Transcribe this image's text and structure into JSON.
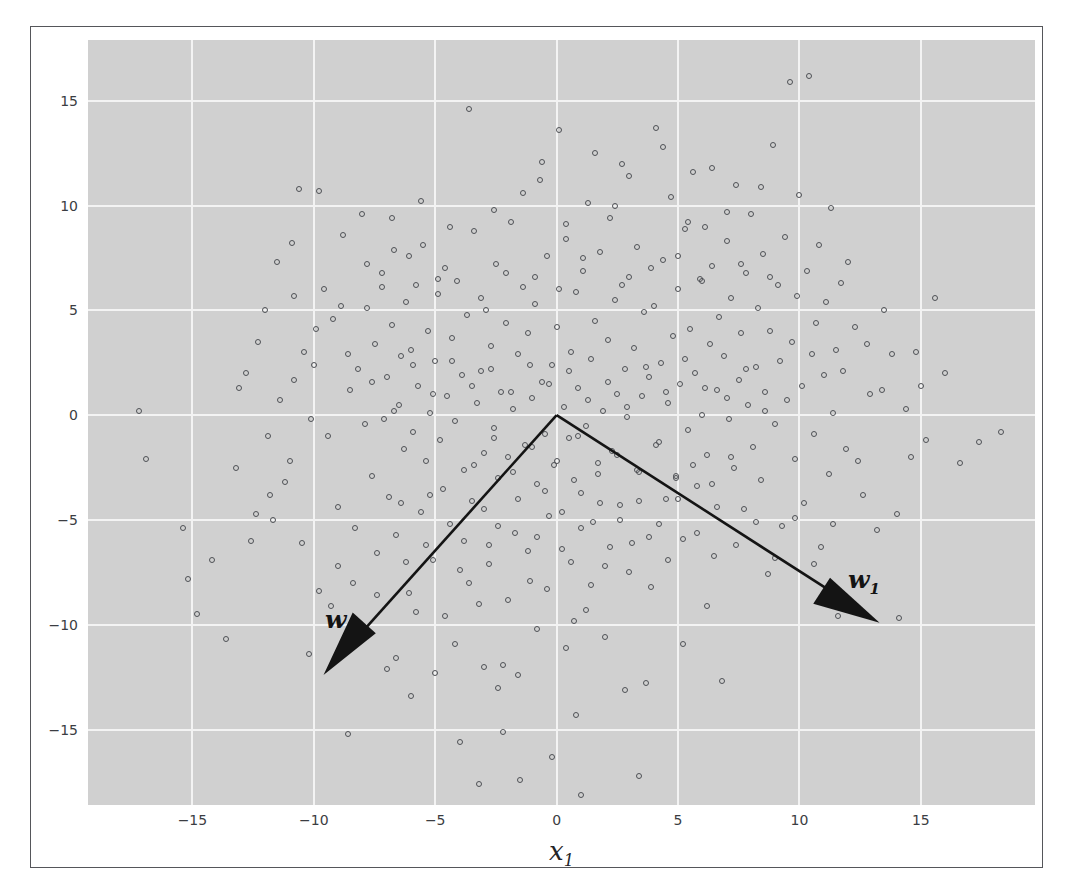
{
  "figure": {
    "background": "#ffffff",
    "frame_color": "#55565a",
    "plot_background": "#d0d0d0",
    "grid_color": "#f3f3f3",
    "marker_color": "#4e5055",
    "arrow_color": "#141414"
  },
  "annotations": {
    "w0_label": "w",
    "w0_sub": "0",
    "w1_label": "w",
    "w1_sub": "1"
  },
  "chart_data": {
    "type": "scatter",
    "title": "",
    "xlabel": "x",
    "xlabel_sub": "1",
    "ylabel": "",
    "xlim": [
      -19.3,
      19.7
    ],
    "ylim": [
      -18.6,
      17.9
    ],
    "grid": true,
    "legend": null,
    "xticks": [
      -15,
      -10,
      -5,
      0,
      5,
      10,
      15
    ],
    "yticks": [
      -15,
      -10,
      -5,
      0,
      5,
      10,
      15
    ],
    "xticklabels": [
      "−15",
      "−10",
      "−5",
      "0",
      "5",
      "10",
      "15"
    ],
    "yticklabels": [
      "−15",
      "−10",
      "−5",
      "0",
      "5",
      "10",
      "15"
    ],
    "marker": "open-circle",
    "marker_size": 6,
    "n_points": 420,
    "vectors": [
      {
        "name": "w0",
        "start": [
          0,
          0
        ],
        "end": [
          -9.6,
          -12.4
        ],
        "label": "w",
        "sub": "0"
      },
      {
        "name": "w1",
        "start": [
          0,
          0
        ],
        "end": [
          13.3,
          -9.9
        ],
        "label": "w",
        "sub": "1"
      }
    ],
    "points": [
      [
        -17.2,
        0.2
      ],
      [
        -16.9,
        -2.1
      ],
      [
        -15.4,
        -5.4
      ],
      [
        -14.8,
        -9.5
      ],
      [
        -13.6,
        -10.7
      ],
      [
        -13.1,
        1.3
      ],
      [
        -12.6,
        -6.0
      ],
      [
        -12.3,
        3.5
      ],
      [
        -11.7,
        -5.0
      ],
      [
        -11.4,
        0.7
      ],
      [
        -11.2,
        -3.2
      ],
      [
        -10.8,
        5.7
      ],
      [
        -10.6,
        10.8
      ],
      [
        -10.4,
        3.0
      ],
      [
        -10.2,
        -11.4
      ],
      [
        -10.0,
        2.4
      ],
      [
        -9.8,
        10.7
      ],
      [
        -9.6,
        6.0
      ],
      [
        -9.4,
        -1.0
      ],
      [
        -9.2,
        4.6
      ],
      [
        -9.0,
        -4.4
      ],
      [
        -8.8,
        8.6
      ],
      [
        -8.6,
        -15.2
      ],
      [
        -8.5,
        1.2
      ],
      [
        -8.3,
        -5.4
      ],
      [
        -8.2,
        2.2
      ],
      [
        -8.0,
        9.6
      ],
      [
        -7.9,
        -0.4
      ],
      [
        -7.8,
        5.1
      ],
      [
        -7.6,
        -2.9
      ],
      [
        -7.5,
        3.4
      ],
      [
        -7.4,
        -6.6
      ],
      [
        -7.2,
        6.8
      ],
      [
        -7.1,
        -0.2
      ],
      [
        -7.0,
        1.8
      ],
      [
        -6.9,
        -3.9
      ],
      [
        -6.8,
        4.3
      ],
      [
        -6.7,
        7.9
      ],
      [
        -6.6,
        -5.7
      ],
      [
        -6.5,
        0.5
      ],
      [
        -6.4,
        2.8
      ],
      [
        -6.3,
        -1.6
      ],
      [
        -6.2,
        5.4
      ],
      [
        -6.1,
        -8.5
      ],
      [
        -6.0,
        3.1
      ],
      [
        -5.9,
        -0.8
      ],
      [
        -5.8,
        6.2
      ],
      [
        -5.7,
        1.4
      ],
      [
        -5.6,
        -4.6
      ],
      [
        -5.5,
        8.1
      ],
      [
        -5.4,
        -2.2
      ],
      [
        -5.3,
        4.0
      ],
      [
        -5.2,
        0.1
      ],
      [
        -5.1,
        -6.9
      ],
      [
        -5.0,
        2.6
      ],
      [
        -4.9,
        5.8
      ],
      [
        -4.8,
        -1.2
      ],
      [
        -4.7,
        -3.5
      ],
      [
        -4.6,
        7.0
      ],
      [
        -4.5,
        0.9
      ],
      [
        -4.4,
        -5.2
      ],
      [
        -4.3,
        3.7
      ],
      [
        -4.2,
        -0.3
      ],
      [
        -4.1,
        6.4
      ],
      [
        -4.0,
        -7.4
      ],
      [
        -3.9,
        1.9
      ],
      [
        -3.8,
        -2.6
      ],
      [
        -3.7,
        4.8
      ],
      [
        -3.6,
        14.6
      ],
      [
        -3.5,
        -4.1
      ],
      [
        -3.4,
        8.8
      ],
      [
        -3.3,
        0.6
      ],
      [
        -3.2,
        -9.0
      ],
      [
        -3.1,
        2.1
      ],
      [
        -3.0,
        -1.8
      ],
      [
        -2.9,
        5.0
      ],
      [
        -2.8,
        -6.2
      ],
      [
        -2.7,
        3.3
      ],
      [
        -2.6,
        -0.6
      ],
      [
        -2.5,
        7.2
      ],
      [
        -2.4,
        -3.0
      ],
      [
        -2.3,
        1.1
      ],
      [
        -2.2,
        -11.9
      ],
      [
        -2.1,
        4.4
      ],
      [
        -2.0,
        -2.0
      ],
      [
        -1.9,
        9.2
      ],
      [
        -1.8,
        0.3
      ],
      [
        -1.7,
        -5.6
      ],
      [
        -1.6,
        2.9
      ],
      [
        -1.5,
        -17.4
      ],
      [
        -1.4,
        6.1
      ],
      [
        -1.3,
        -1.4
      ],
      [
        -1.2,
        3.9
      ],
      [
        -1.1,
        -7.9
      ],
      [
        -1.0,
        0.8
      ],
      [
        -0.9,
        5.3
      ],
      [
        -0.8,
        -3.3
      ],
      [
        -0.7,
        11.2
      ],
      [
        -0.6,
        1.6
      ],
      [
        -0.5,
        -0.9
      ],
      [
        -0.4,
        7.6
      ],
      [
        -0.3,
        -4.8
      ],
      [
        -0.2,
        2.4
      ],
      [
        -0.1,
        -2.4
      ],
      [
        0.0,
        4.2
      ],
      [
        0.1,
        13.6
      ],
      [
        0.2,
        -6.4
      ],
      [
        0.3,
        0.4
      ],
      [
        0.4,
        8.4
      ],
      [
        0.5,
        -1.1
      ],
      [
        0.6,
        3.0
      ],
      [
        0.7,
        -9.8
      ],
      [
        0.8,
        5.9
      ],
      [
        0.9,
        1.3
      ],
      [
        1.0,
        -3.7
      ],
      [
        1.1,
        6.9
      ],
      [
        1.2,
        -0.5
      ],
      [
        1.3,
        10.1
      ],
      [
        1.4,
        2.7
      ],
      [
        1.5,
        -5.1
      ],
      [
        1.6,
        4.5
      ],
      [
        1.7,
        -2.3
      ],
      [
        1.8,
        7.8
      ],
      [
        1.9,
        0.2
      ],
      [
        2.0,
        -7.2
      ],
      [
        2.1,
        3.6
      ],
      [
        2.2,
        9.4
      ],
      [
        2.3,
        -1.7
      ],
      [
        2.4,
        5.5
      ],
      [
        2.5,
        1.0
      ],
      [
        2.6,
        -4.3
      ],
      [
        2.7,
        12.0
      ],
      [
        2.8,
        2.2
      ],
      [
        2.9,
        -0.1
      ],
      [
        3.0,
        6.6
      ],
      [
        3.1,
        -6.1
      ],
      [
        3.2,
        3.2
      ],
      [
        3.3,
        8.0
      ],
      [
        3.4,
        -2.7
      ],
      [
        3.5,
        0.9
      ],
      [
        3.6,
        4.9
      ],
      [
        3.7,
        -12.8
      ],
      [
        3.8,
        1.8
      ],
      [
        3.9,
        -8.2
      ],
      [
        4.0,
        5.2
      ],
      [
        4.1,
        13.7
      ],
      [
        4.2,
        -1.3
      ],
      [
        4.3,
        2.5
      ],
      [
        4.4,
        7.4
      ],
      [
        4.5,
        -4.0
      ],
      [
        4.6,
        0.6
      ],
      [
        4.7,
        10.4
      ],
      [
        4.8,
        3.8
      ],
      [
        4.9,
        -2.9
      ],
      [
        5.0,
        6.0
      ],
      [
        5.1,
        1.5
      ],
      [
        5.2,
        -5.9
      ],
      [
        5.3,
        8.9
      ],
      [
        5.4,
        -0.7
      ],
      [
        5.5,
        4.1
      ],
      [
        5.6,
        11.6
      ],
      [
        5.7,
        2.0
      ],
      [
        5.8,
        -3.4
      ],
      [
        5.9,
        6.5
      ],
      [
        6.0,
        0.0
      ],
      [
        6.1,
        9.0
      ],
      [
        6.2,
        -1.9
      ],
      [
        6.3,
        3.4
      ],
      [
        6.4,
        7.1
      ],
      [
        6.5,
        -6.7
      ],
      [
        6.6,
        1.2
      ],
      [
        6.7,
        4.7
      ],
      [
        6.8,
        -12.7
      ],
      [
        6.9,
        2.8
      ],
      [
        7.0,
        8.3
      ],
      [
        7.1,
        -0.2
      ],
      [
        7.2,
        5.6
      ],
      [
        7.3,
        -2.5
      ],
      [
        7.4,
        11.0
      ],
      [
        7.5,
        1.7
      ],
      [
        7.6,
        3.9
      ],
      [
        7.7,
        -4.5
      ],
      [
        7.8,
        6.8
      ],
      [
        7.9,
        0.5
      ],
      [
        8.0,
        9.6
      ],
      [
        8.1,
        -1.5
      ],
      [
        8.2,
        2.3
      ],
      [
        8.3,
        5.1
      ],
      [
        8.4,
        -3.1
      ],
      [
        8.5,
        7.7
      ],
      [
        8.6,
        1.1
      ],
      [
        8.7,
        -7.6
      ],
      [
        8.8,
        4.0
      ],
      [
        8.9,
        12.9
      ],
      [
        9.0,
        -0.4
      ],
      [
        9.1,
        6.2
      ],
      [
        9.2,
        2.6
      ],
      [
        9.3,
        -5.3
      ],
      [
        9.4,
        8.5
      ],
      [
        9.5,
        0.7
      ],
      [
        9.6,
        15.9
      ],
      [
        9.7,
        3.5
      ],
      [
        9.8,
        -2.1
      ],
      [
        9.9,
        5.7
      ],
      [
        10.0,
        10.5
      ],
      [
        10.1,
        1.4
      ],
      [
        10.2,
        -4.2
      ],
      [
        10.3,
        6.9
      ],
      [
        10.4,
        16.2
      ],
      [
        10.5,
        2.9
      ],
      [
        10.6,
        -0.9
      ],
      [
        10.7,
        4.4
      ],
      [
        10.8,
        8.1
      ],
      [
        10.9,
        -6.3
      ],
      [
        11.0,
        1.9
      ],
      [
        11.1,
        5.4
      ],
      [
        11.2,
        -2.8
      ],
      [
        11.3,
        9.9
      ],
      [
        11.4,
        0.1
      ],
      [
        11.5,
        3.1
      ],
      [
        11.6,
        -9.6
      ],
      [
        11.7,
        6.3
      ],
      [
        11.8,
        2.1
      ],
      [
        11.9,
        -1.6
      ],
      [
        12.0,
        7.3
      ],
      [
        12.3,
        4.2
      ],
      [
        12.6,
        -3.8
      ],
      [
        12.9,
        1.0
      ],
      [
        13.2,
        -5.5
      ],
      [
        13.5,
        5.0
      ],
      [
        13.8,
        2.9
      ],
      [
        14.1,
        -9.7
      ],
      [
        14.4,
        0.3
      ],
      [
        14.8,
        3.0
      ],
      [
        15.2,
        -1.2
      ],
      [
        15.6,
        5.6
      ],
      [
        16.0,
        2.0
      ],
      [
        16.6,
        -2.3
      ],
      [
        17.4,
        -1.3
      ],
      [
        18.3,
        -0.8
      ],
      [
        -3.0,
        -12.0
      ],
      [
        -2.4,
        -13.0
      ],
      [
        -1.6,
        -12.4
      ],
      [
        -0.8,
        -10.2
      ],
      [
        0.4,
        -11.1
      ],
      [
        1.2,
        -9.3
      ],
      [
        2.0,
        -10.6
      ],
      [
        -4.2,
        -10.9
      ],
      [
        -5.0,
        -12.3
      ],
      [
        -5.8,
        -9.4
      ],
      [
        -6.6,
        -11.6
      ],
      [
        -7.4,
        -8.6
      ],
      [
        -8.1,
        -10.1
      ],
      [
        -3.6,
        -8.0
      ],
      [
        -2.8,
        -7.1
      ],
      [
        -2.0,
        -8.8
      ],
      [
        -1.2,
        -6.5
      ],
      [
        -0.4,
        -8.3
      ],
      [
        0.6,
        -7.0
      ],
      [
        1.4,
        -8.1
      ],
      [
        2.2,
        -6.3
      ],
      [
        3.0,
        -7.5
      ],
      [
        3.8,
        -5.8
      ],
      [
        4.6,
        -6.9
      ],
      [
        -9.0,
        -7.2
      ],
      [
        -9.8,
        -8.4
      ],
      [
        -10.5,
        -6.1
      ],
      [
        -11.0,
        -2.2
      ],
      [
        -11.9,
        -1.0
      ],
      [
        -12.8,
        2.0
      ],
      [
        -4.0,
        -15.6
      ],
      [
        -2.2,
        -15.1
      ],
      [
        0.8,
        -14.3
      ],
      [
        2.8,
        -13.1
      ],
      [
        -6.0,
        -13.4
      ],
      [
        -7.0,
        -12.1
      ],
      [
        5.2,
        -10.9
      ],
      [
        6.2,
        -9.1
      ],
      [
        -3.2,
        -17.6
      ],
      [
        3.4,
        -17.2
      ],
      [
        -0.2,
        -16.3
      ],
      [
        1.0,
        -18.1
      ],
      [
        -12.0,
        5.0
      ],
      [
        -11.5,
        7.3
      ],
      [
        -10.9,
        8.2
      ],
      [
        -10.1,
        -0.2
      ],
      [
        -9.3,
        -9.1
      ],
      [
        -8.4,
        -8.0
      ],
      [
        -7.8,
        -10.4
      ],
      [
        -6.2,
        -7.0
      ],
      [
        -5.4,
        -6.2
      ],
      [
        -4.6,
        -9.6
      ],
      [
        -3.8,
        -6.0
      ],
      [
        -3.0,
        -4.5
      ],
      [
        -2.4,
        -5.3
      ],
      [
        -1.6,
        -4.0
      ],
      [
        -0.8,
        -5.8
      ],
      [
        0.2,
        -4.6
      ],
      [
        1.0,
        -5.4
      ],
      [
        1.8,
        -4.2
      ],
      [
        2.6,
        -5.0
      ],
      [
        3.4,
        -4.1
      ],
      [
        4.2,
        -5.2
      ],
      [
        5.0,
        -4.0
      ],
      [
        5.8,
        -5.6
      ],
      [
        6.6,
        -4.4
      ],
      [
        7.4,
        -6.2
      ],
      [
        8.2,
        -5.1
      ],
      [
        9.0,
        -6.8
      ],
      [
        9.8,
        -4.9
      ],
      [
        10.6,
        -7.1
      ],
      [
        11.4,
        -5.2
      ],
      [
        -0.6,
        12.1
      ],
      [
        1.6,
        12.5
      ],
      [
        3.0,
        11.4
      ],
      [
        4.4,
        12.8
      ],
      [
        6.4,
        11.8
      ],
      [
        8.4,
        10.9
      ],
      [
        -1.4,
        10.6
      ],
      [
        -2.6,
        9.8
      ],
      [
        -4.4,
        9.0
      ],
      [
        -5.6,
        10.2
      ],
      [
        -6.8,
        9.4
      ],
      [
        -7.8,
        7.2
      ],
      [
        0.4,
        9.1
      ],
      [
        2.4,
        10.0
      ],
      [
        5.4,
        9.2
      ],
      [
        7.0,
        9.7
      ],
      [
        -8.9,
        5.2
      ],
      [
        -9.9,
        4.1
      ],
      [
        -10.8,
        1.7
      ],
      [
        -11.8,
        -3.8
      ],
      [
        -12.4,
        -4.7
      ],
      [
        -13.2,
        -2.5
      ],
      [
        -14.2,
        -6.9
      ],
      [
        -15.2,
        -7.8
      ],
      [
        12.4,
        -2.2
      ],
      [
        12.8,
        3.4
      ],
      [
        13.4,
        1.2
      ],
      [
        14.0,
        -4.7
      ],
      [
        14.6,
        -2.0
      ],
      [
        15.0,
        1.4
      ],
      [
        -1.0,
        -1.5
      ],
      [
        0.0,
        -2.2
      ],
      [
        0.9,
        -1.0
      ],
      [
        1.7,
        -2.8
      ],
      [
        -1.8,
        -2.7
      ],
      [
        -2.6,
        -1.1
      ],
      [
        -3.4,
        -2.4
      ],
      [
        2.5,
        -1.9
      ],
      [
        3.3,
        -2.6
      ],
      [
        4.1,
        -1.4
      ],
      [
        -0.5,
        -3.6
      ],
      [
        0.7,
        -3.1
      ],
      [
        -5.2,
        -3.8
      ],
      [
        -6.4,
        -4.2
      ],
      [
        4.9,
        -3.0
      ],
      [
        5.6,
        -2.4
      ],
      [
        6.4,
        -3.3
      ],
      [
        7.2,
        -2.0
      ],
      [
        -0.3,
        1.5
      ],
      [
        0.5,
        2.1
      ],
      [
        1.3,
        0.7
      ],
      [
        -1.1,
        2.4
      ],
      [
        -1.9,
        1.1
      ],
      [
        -2.7,
        2.2
      ],
      [
        2.1,
        1.6
      ],
      [
        2.9,
        0.4
      ],
      [
        3.7,
        2.3
      ],
      [
        -3.5,
        1.4
      ],
      [
        -4.3,
        2.6
      ],
      [
        4.5,
        1.1
      ],
      [
        -5.1,
        1.0
      ],
      [
        -5.9,
        2.4
      ],
      [
        5.3,
        2.7
      ],
      [
        6.1,
        1.3
      ],
      [
        -6.7,
        0.2
      ],
      [
        -7.6,
        1.6
      ],
      [
        7.0,
        0.8
      ],
      [
        7.8,
        2.2
      ],
      [
        8.6,
        0.2
      ],
      [
        -8.6,
        2.9
      ],
      [
        -0.9,
        6.6
      ],
      [
        0.1,
        6.0
      ],
      [
        1.1,
        7.5
      ],
      [
        -2.1,
        6.8
      ],
      [
        -3.1,
        5.6
      ],
      [
        2.7,
        6.2
      ],
      [
        3.9,
        7.0
      ],
      [
        -4.9,
        6.5
      ],
      [
        5.0,
        7.6
      ],
      [
        6.0,
        6.4
      ],
      [
        -6.1,
        7.6
      ],
      [
        -7.2,
        6.1
      ],
      [
        7.6,
        7.2
      ],
      [
        8.8,
        6.6
      ]
    ]
  }
}
